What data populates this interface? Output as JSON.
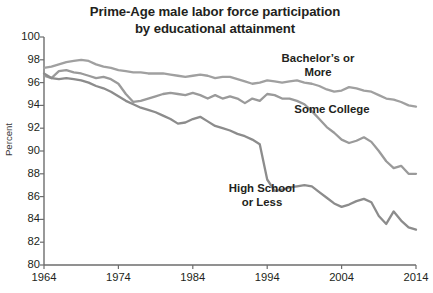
{
  "chart_data": {
    "type": "line",
    "title": "Prime-Age male labor force participation by educational attainment",
    "title_line1": "Prime-Age male labor force participation",
    "title_line2": "by educational attainment",
    "xlabel": "",
    "ylabel": "Percent",
    "xlim": [
      1964,
      2014
    ],
    "ylim": [
      80,
      100
    ],
    "xticks": [
      1964,
      1974,
      1984,
      1994,
      2004,
      2014
    ],
    "yticks": [
      80,
      82,
      84,
      86,
      88,
      90,
      92,
      94,
      96,
      98,
      100
    ],
    "grid": false,
    "legend_position": "inline-annotations",
    "x": [
      1964,
      1965,
      1966,
      1967,
      1968,
      1969,
      1970,
      1971,
      1972,
      1973,
      1974,
      1975,
      1976,
      1977,
      1978,
      1979,
      1980,
      1981,
      1982,
      1983,
      1984,
      1985,
      1986,
      1987,
      1988,
      1989,
      1990,
      1991,
      1992,
      1993,
      1994,
      1995,
      1996,
      1997,
      1998,
      1999,
      2000,
      2001,
      2002,
      2003,
      2004,
      2005,
      2006,
      2007,
      2008,
      2009,
      2010,
      2011,
      2012,
      2013,
      2014
    ],
    "series": [
      {
        "name": "Bachelor's or More",
        "label_line1": "Bachelor’s or",
        "label_line2": "More",
        "color": "#a0a0a0",
        "values": [
          97.3,
          97.4,
          97.6,
          97.8,
          97.9,
          98.0,
          97.9,
          97.6,
          97.4,
          97.3,
          97.1,
          97.0,
          96.9,
          96.9,
          96.8,
          96.8,
          96.8,
          96.7,
          96.6,
          96.5,
          96.6,
          96.7,
          96.6,
          96.4,
          96.5,
          96.5,
          96.3,
          96.1,
          95.9,
          96.0,
          96.2,
          96.1,
          96.0,
          96.1,
          96.2,
          96.0,
          95.9,
          95.7,
          95.4,
          95.2,
          95.3,
          95.6,
          95.5,
          95.3,
          95.2,
          94.9,
          94.6,
          94.5,
          94.3,
          94.0,
          93.9
        ]
      },
      {
        "name": "Some College",
        "label": "Some College",
        "color": "#9a9a9a",
        "values": [
          96.6,
          96.4,
          97.0,
          97.1,
          96.9,
          96.8,
          96.6,
          96.4,
          96.5,
          96.3,
          95.9,
          95.0,
          94.3,
          94.4,
          94.6,
          94.8,
          95.0,
          95.1,
          95.0,
          94.9,
          95.1,
          94.9,
          94.6,
          94.9,
          94.6,
          94.8,
          94.6,
          94.2,
          94.6,
          94.4,
          95.0,
          94.9,
          94.6,
          94.6,
          94.4,
          94.1,
          93.5,
          92.8,
          92.1,
          91.6,
          91.0,
          90.7,
          90.9,
          91.2,
          90.8,
          90.0,
          89.1,
          88.5,
          88.7,
          88.0,
          88.0
        ]
      },
      {
        "name": "High School or Less",
        "label_line1": "High School",
        "label_line2": "or Less",
        "color": "#8c8c8c",
        "values": [
          96.8,
          96.4,
          96.3,
          96.4,
          96.3,
          96.2,
          96.0,
          95.7,
          95.5,
          95.2,
          94.8,
          94.4,
          94.1,
          93.8,
          93.6,
          93.4,
          93.1,
          92.8,
          92.4,
          92.5,
          92.8,
          93.0,
          92.6,
          92.2,
          92.0,
          91.8,
          91.5,
          91.3,
          91.0,
          90.6,
          87.5,
          86.5,
          86.6,
          86.8,
          86.9,
          87.0,
          86.9,
          86.4,
          85.9,
          85.4,
          85.1,
          85.3,
          85.6,
          85.8,
          85.5,
          84.3,
          83.6,
          84.7,
          83.9,
          83.3,
          83.1
        ]
      }
    ]
  },
  "axis": {
    "ylabel": "Percent",
    "ytick_labels": [
      "100",
      "98",
      "96",
      "94",
      "92",
      "90",
      "88",
      "86",
      "84",
      "82",
      "80"
    ],
    "xtick_labels": [
      "1964",
      "1974",
      "1984",
      "1994",
      "2004",
      "2014"
    ]
  },
  "colors": {
    "axis": "#6d6d6d",
    "text": "#231f20",
    "background": "#ffffff"
  }
}
